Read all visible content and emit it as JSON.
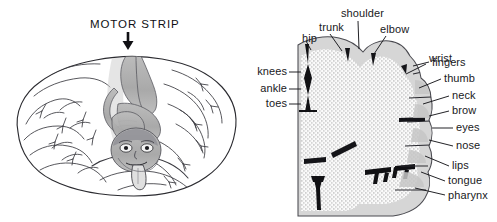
{
  "figure": {
    "caption_title": "MOTOR STRIP",
    "colors": {
      "ink": "#19191c",
      "outline": "#2b2b30",
      "cortex_band": "#d2d2d2",
      "cortex_fill": "#f2f2f2",
      "stipple": "#8c8c8c",
      "sulcus": "#111114",
      "homunculus_shade": "#a6a6a6",
      "background": "#ffffff"
    }
  },
  "left_panel": {
    "name": "brain-with-homunculus",
    "title": "MOTOR STRIP",
    "arrow": {
      "name": "motor-strip-arrow",
      "direction": "down"
    },
    "homunculus": {
      "name": "inverted-homunculus",
      "description": "inverted human figure draped over the motor strip"
    }
  },
  "right_panel": {
    "name": "cortical-cross-section",
    "top_labels": [
      {
        "text": "hip",
        "x": 53,
        "y": 32
      },
      {
        "text": "trunk",
        "x": 70,
        "y": 21
      },
      {
        "text": "shoulder",
        "x": 102,
        "y": 7
      },
      {
        "text": "elbow",
        "x": 144,
        "y": 23
      },
      {
        "text": "wrist",
        "x": 177,
        "y": 52
      }
    ],
    "left_labels": [
      {
        "text": "knees",
        "x": 4,
        "y": 69
      },
      {
        "text": "ankle",
        "x": 4,
        "y": 86
      },
      {
        "text": "toes",
        "x": 4,
        "y": 101
      }
    ],
    "right_labels": [
      {
        "text": "fingers",
        "x": 166,
        "y": 60
      },
      {
        "text": "thumb",
        "x": 180,
        "y": 75
      },
      {
        "text": "neck",
        "x": 187,
        "y": 92
      },
      {
        "text": "brow",
        "x": 187,
        "y": 107
      },
      {
        "text": "eyes",
        "x": 190,
        "y": 125
      },
      {
        "text": "nose",
        "x": 190,
        "y": 142
      },
      {
        "text": "lips",
        "x": 186,
        "y": 162
      },
      {
        "text": "tongue",
        "x": 182,
        "y": 177
      },
      {
        "text": "pharynx",
        "x": 182,
        "y": 191
      }
    ]
  }
}
